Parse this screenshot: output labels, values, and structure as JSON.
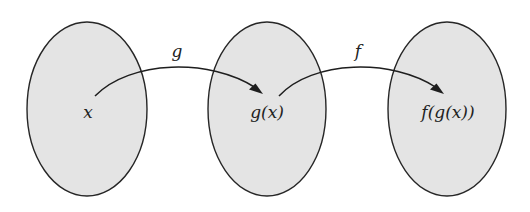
{
  "diagram": {
    "type": "function-composition",
    "colors": {
      "set_fill": "#e4e4e4",
      "set_stroke": "#262626",
      "arrow": "#1e1e1e",
      "text": "#222222",
      "background": "#ffffff"
    },
    "sets": [
      {
        "id": "domain",
        "element_label": "x"
      },
      {
        "id": "intermediate",
        "element_label": "g(x)"
      },
      {
        "id": "codomain",
        "element_label": "f(g(x))"
      }
    ],
    "arrows": [
      {
        "from": "x",
        "to": "g(x)",
        "label": "g"
      },
      {
        "from": "g(x)",
        "to": "f(g(x))",
        "label": "f"
      }
    ]
  }
}
